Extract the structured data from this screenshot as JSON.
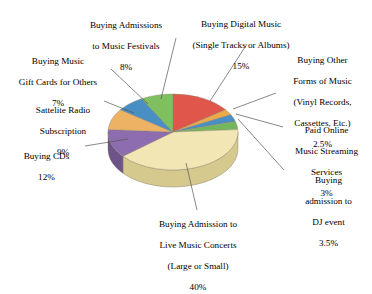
{
  "chart_data": {
    "type": "pie",
    "title": "",
    "legend_position": "callout-labels",
    "three_d": true,
    "categories": [
      "Buying Digital Music (Single Tracks or Albums)",
      "Buying Other Forms of Music (Vinyl Records, Cassettes, Etc.)",
      "Paid Online Music Streaming Services",
      "Buying admission to DJ event",
      "Buying Admission to Live Music Concerts (Large or Small)",
      "Buying CDs",
      "Sattelite Radio Subscription",
      "Buying Music Gift Cards for Others",
      "Buying Admissions to Music Festivals"
    ],
    "values": [
      15,
      2.5,
      3,
      3.5,
      40,
      12,
      9,
      7,
      8
    ],
    "value_labels": [
      "15%",
      "2.5%",
      "3%",
      "3.5%",
      "40%",
      "12%",
      "9%",
      "7%",
      "8%"
    ],
    "colors": [
      "#e0564b",
      "#eaa94a",
      "#4a8fc4",
      "#74b65c",
      "#f2e7b4",
      "#8d6cb0",
      "#edb263",
      "#4a8fc4",
      "#7fbf5e"
    ],
    "side_colors": [
      "#b8413a",
      "#c08a35",
      "#3a7099",
      "#5c9049",
      "#d6c98e",
      "#6e5389",
      "#c08d46",
      "#3a7099",
      "#64974a"
    ],
    "xlabel": "",
    "ylabel": ""
  },
  "labels": {
    "digital_music": {
      "lines": [
        "Buying Digital Music",
        "(Single Tracks or Albums)"
      ],
      "line1": "Buying Digital Music",
      "line2": "(Single Tracks or Albums)",
      "pct": "15%"
    },
    "other_forms": {
      "line1": "Buying Other",
      "line2": "Forms of Music",
      "line3": "(Vinyl Records,",
      "line4": "Cassettes, Etc.)",
      "pct": "2.5%"
    },
    "paid_streaming": {
      "line1": "Paid Online",
      "line2": "Music Streaming",
      "line3": "Services",
      "pct": "3%"
    },
    "dj_event": {
      "line1": "Buying",
      "line2": "admission to",
      "line3": "DJ event",
      "pct": "3.5%"
    },
    "live_concerts": {
      "line1": "Buying Admission to",
      "line2": "Live Music Concerts",
      "line3": "(Large or Small)",
      "pct": "40%"
    },
    "cds": {
      "line1": "Buying CDs",
      "pct": "12%"
    },
    "satellite_radio": {
      "line1": "Sattelite Radio",
      "line2": "Subscription",
      "pct": "9%"
    },
    "gift_cards": {
      "line1": "Buying Music",
      "line2": "Gift Cards for Others",
      "pct": "7%"
    },
    "festivals": {
      "line1": "Buying Admissions",
      "line2": "to Music Festivals",
      "pct": "8%"
    }
  }
}
